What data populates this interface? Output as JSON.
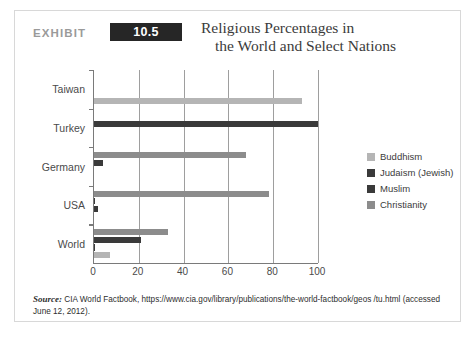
{
  "header": {
    "exhibit_label": "EXHIBIT",
    "exhibit_number": "10.5",
    "title_line1": "Religious Percentages in",
    "title_line2": "the World and Select Nations"
  },
  "source": {
    "label": "Source:",
    "text": "CIA World Factbook, https://www.cia.gov/library/publications/the-world-factbook/geos /tu.html (accessed June 12, 2012)."
  },
  "colors": {
    "buddhism": "#b5b5b5",
    "judaism": "#3a3a3a",
    "muslim": "#3a3a3a",
    "christianity": "#8c8c8c",
    "axis": "#7a7a7a",
    "grid": "#9e9e9e",
    "badge_bg": "#262626",
    "card_border": "#d8d8d8"
  },
  "chart_data": {
    "type": "bar",
    "orientation": "horizontal",
    "title": "Religious Percentages in the World and Select Nations",
    "xlabel": "",
    "ylabel": "",
    "xlim": [
      0,
      100
    ],
    "xticks": [
      0,
      20,
      40,
      60,
      80,
      100
    ],
    "grid": true,
    "legend_position": "right",
    "categories": [
      "Taiwan",
      "Turkey",
      "Germany",
      "USA",
      "World"
    ],
    "series": [
      {
        "name": "Christianity",
        "color": "#8c8c8c",
        "values": [
          0,
          0,
          68,
          78,
          33
        ]
      },
      {
        "name": "Muslim",
        "color": "#3a3a3a",
        "values": [
          0,
          100,
          4,
          0.6,
          21
        ]
      },
      {
        "name": "Judaism (Jewish)",
        "color": "#3a3a3a",
        "values": [
          0,
          0,
          0,
          1.7,
          0.2
        ]
      },
      {
        "name": "Buddhism",
        "color": "#b5b5b5",
        "values": [
          93,
          0,
          0,
          0,
          7
        ]
      }
    ],
    "legend": [
      {
        "label": "Buddhism",
        "color": "#b5b5b5"
      },
      {
        "label": "Judaism (Jewish)",
        "color": "#3a3a3a"
      },
      {
        "label": "Muslim",
        "color": "#3a3a3a"
      },
      {
        "label": "Christianity",
        "color": "#8c8c8c"
      }
    ]
  }
}
